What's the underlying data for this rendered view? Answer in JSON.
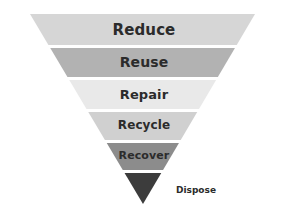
{
  "diagram": {
    "type": "inverted-funnel",
    "background_color": "#ffffff",
    "text_color": "#2b2b2b",
    "apex_x": 143,
    "apex_y": 204,
    "top_left_x": 30,
    "top_right_x": 255,
    "top_y": 14,
    "levels": [
      {
        "label": "Reduce",
        "rank": 1,
        "color": "#d6d6d6",
        "top_y": 14,
        "bottom_y": 45,
        "label_x": 144,
        "label_y": 30,
        "font_size": 15
      },
      {
        "label": "Reuse",
        "rank": 2,
        "color": "#b2b2b2",
        "top_y": 48,
        "bottom_y": 77,
        "label_x": 144,
        "label_y": 62,
        "font_size": 14
      },
      {
        "label": "Repair",
        "rank": 3,
        "color": "#e9e9e9",
        "top_y": 80,
        "bottom_y": 109,
        "label_x": 144,
        "label_y": 94,
        "font_size": 13
      },
      {
        "label": "Recycle",
        "rank": 4,
        "color": "#d0d0d0",
        "top_y": 112,
        "bottom_y": 140,
        "label_x": 144,
        "label_y": 125,
        "font_size": 12
      },
      {
        "label": "Recover",
        "rank": 5,
        "color": "#8c8c8c",
        "top_y": 143,
        "bottom_y": 170,
        "label_x": 144,
        "label_y": 155,
        "font_size": 11
      },
      {
        "label": "Dispose",
        "rank": 6,
        "color": "#3c3c3c",
        "top_y": 173,
        "bottom_y": 204,
        "label_x": 176,
        "label_y": 190,
        "font_size": 9,
        "label_outside": true
      }
    ]
  }
}
